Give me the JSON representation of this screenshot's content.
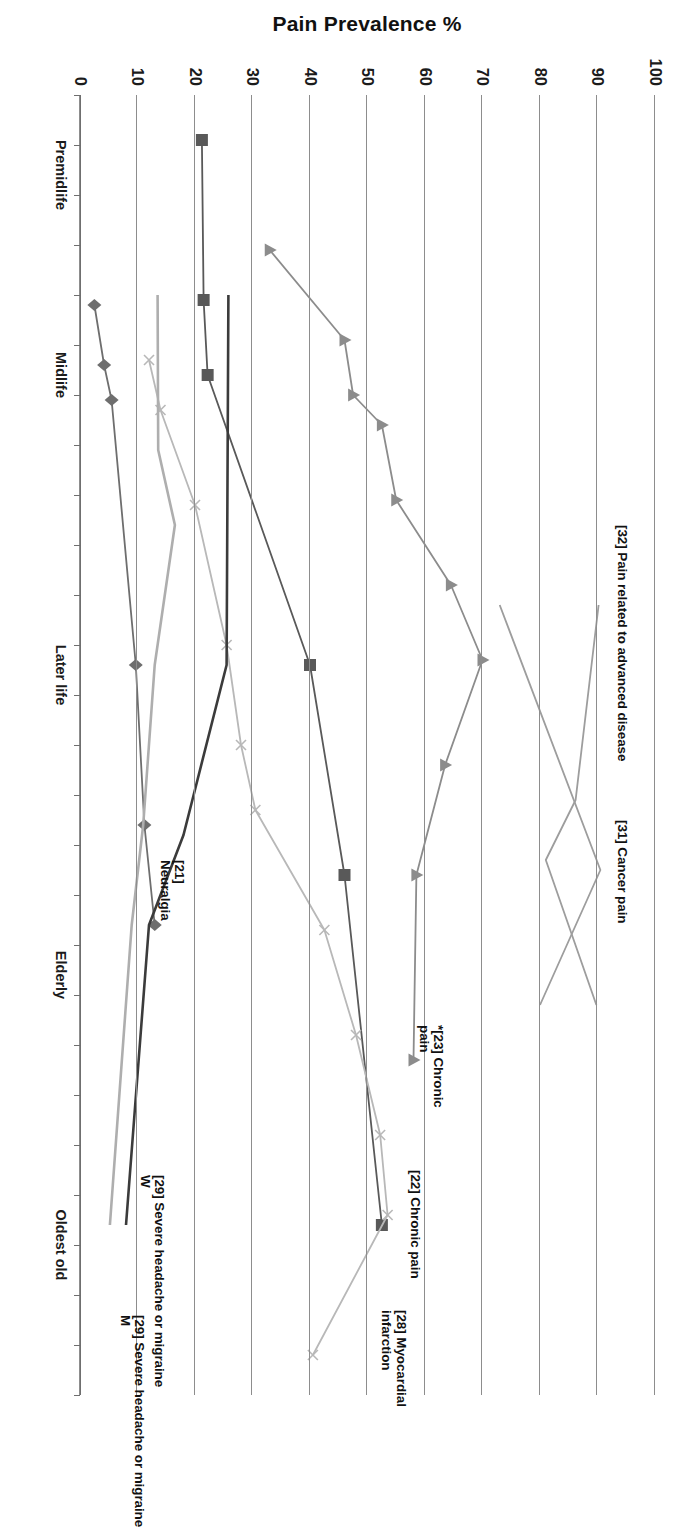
{
  "chart_data": {
    "type": "line",
    "title": "",
    "xlabel": "",
    "ylabel": "Pain Prevalence %",
    "ylim": [
      0,
      100
    ],
    "ytick_labels": [
      "100",
      "90",
      "80",
      "70",
      "60",
      "50",
      "40",
      "30",
      "20",
      "10",
      "0"
    ],
    "ytick_values": [
      100,
      90,
      80,
      70,
      60,
      50,
      40,
      30,
      20,
      10,
      0
    ],
    "grid": "horizontal-only",
    "legend": "inline-end-labels",
    "x": [
      0,
      1,
      2,
      3,
      4,
      5,
      6,
      7,
      8,
      9,
      10,
      11,
      12,
      13,
      14,
      15,
      16,
      17,
      18,
      19,
      20,
      21,
      22,
      23,
      24,
      25,
      26
    ],
    "categories": [
      "Premidlife",
      "Midlife",
      "Later life",
      "Elderly",
      "Oldest old"
    ],
    "category_positions": [
      1.6,
      5.6,
      11.6,
      17.6,
      23.0
    ],
    "series": [
      {
        "name": "[32] Pain related to advanced disease",
        "label": "[32] Pain related to advanced disease",
        "marker": "none",
        "color": "#9d9d9d",
        "points": [
          {
            "x": 10.2,
            "y": 73.0
          },
          {
            "x": 15.5,
            "y": 90.5
          },
          {
            "x": 18.2,
            "y": 80.0
          }
        ]
      },
      {
        "name": "[31] Cancer pain",
        "label": "[31] Cancer pain",
        "marker": "none",
        "color": "#9d9d9d",
        "points": [
          {
            "x": 10.2,
            "y": 90.2
          },
          {
            "x": 14.1,
            "y": 86.2
          },
          {
            "x": 15.3,
            "y": 81.0
          },
          {
            "x": 18.2,
            "y": 89.8
          }
        ]
      },
      {
        "name": "*[23] Chronic pain",
        "label": "*[23] Chronic\npain",
        "marker": "triangle",
        "color": "#8c8c8c",
        "points": [
          {
            "x": 3.1,
            "y": 33.0
          },
          {
            "x": 4.9,
            "y": 46.0
          },
          {
            "x": 6.0,
            "y": 47.5
          },
          {
            "x": 6.6,
            "y": 52.5
          },
          {
            "x": 8.1,
            "y": 55.0
          },
          {
            "x": 9.8,
            "y": 64.5
          },
          {
            "x": 11.3,
            "y": 70.0
          },
          {
            "x": 13.4,
            "y": 63.5
          },
          {
            "x": 15.6,
            "y": 58.5
          },
          {
            "x": 19.3,
            "y": 58.0
          }
        ]
      },
      {
        "name": "[22] Chronic pain",
        "label": "[22] Chronic pain",
        "marker": "square",
        "color": "#595959",
        "points": [
          {
            "x": 0.9,
            "y": 21.2
          },
          {
            "x": 4.1,
            "y": 21.5
          },
          {
            "x": 5.6,
            "y": 22.2
          },
          {
            "x": 11.4,
            "y": 40.0
          },
          {
            "x": 15.6,
            "y": 46.0
          },
          {
            "x": 22.6,
            "y": 52.5
          }
        ]
      },
      {
        "name": "[28] Myocardial infarction",
        "label": "[28] Myocardial\ninfarction",
        "marker": "cross",
        "color": "#b8b8b8",
        "points": [
          {
            "x": 5.3,
            "y": 12.0
          },
          {
            "x": 6.3,
            "y": 14.0
          },
          {
            "x": 8.2,
            "y": 20.0
          },
          {
            "x": 11.0,
            "y": 25.5
          },
          {
            "x": 13.0,
            "y": 28.0
          },
          {
            "x": 14.3,
            "y": 30.5
          },
          {
            "x": 16.7,
            "y": 42.5
          },
          {
            "x": 18.8,
            "y": 48.0
          },
          {
            "x": 20.8,
            "y": 52.2
          },
          {
            "x": 22.4,
            "y": 53.5
          },
          {
            "x": 25.2,
            "y": 40.5
          }
        ]
      },
      {
        "name": "[21] Neuralgia",
        "label": "[21]\nNeuralgia",
        "marker": "diamond",
        "color": "#6e6e6e",
        "points": [
          {
            "x": 4.2,
            "y": 2.5
          },
          {
            "x": 5.4,
            "y": 4.2
          },
          {
            "x": 6.1,
            "y": 5.5
          },
          {
            "x": 11.4,
            "y": 9.7
          },
          {
            "x": 14.6,
            "y": 11.2
          },
          {
            "x": 16.6,
            "y": 13.0
          }
        ]
      },
      {
        "name": "[29] Severe headache or migraine W",
        "label": "[29] Severe headache or migraine\nW",
        "marker": "none",
        "color": "#3b3b3b",
        "points": [
          {
            "x": 4.0,
            "y": 25.8
          },
          {
            "x": 11.4,
            "y": 25.5
          },
          {
            "x": 14.8,
            "y": 18.0
          },
          {
            "x": 16.6,
            "y": 12.0
          },
          {
            "x": 22.6,
            "y": 8.0
          }
        ]
      },
      {
        "name": "[29] Severe headache or migraine M",
        "label": "[29] Severe headache or migraine\nM",
        "marker": "none",
        "color": "#aeaeae",
        "points": [
          {
            "x": 4.0,
            "y": 13.5
          },
          {
            "x": 7.1,
            "y": 13.6
          },
          {
            "x": 8.6,
            "y": 16.5
          },
          {
            "x": 11.4,
            "y": 13.0
          },
          {
            "x": 14.6,
            "y": 11.0
          },
          {
            "x": 16.6,
            "y": 9.0
          },
          {
            "x": 22.6,
            "y": 5.2
          }
        ]
      }
    ],
    "annotations": [
      {
        "id": "ann-32",
        "text": "[32] Pain related to advanced disease"
      },
      {
        "id": "ann-31",
        "text": "[31] Cancer pain"
      },
      {
        "id": "ann-23",
        "text": "*[23] Chronic\npain"
      },
      {
        "id": "ann-22",
        "text": "[22] Chronic pain"
      },
      {
        "id": "ann-28",
        "text": "[28] Myocardial\ninfarction"
      },
      {
        "id": "ann-21",
        "text": "[21]\nNeuralgia"
      },
      {
        "id": "ann-29w",
        "text": "[29] Severe headache or migraine\nW"
      },
      {
        "id": "ann-29m",
        "text": "[29] Severe headache or migraine\nM"
      }
    ]
  },
  "axis": {
    "y_title": "Pain Prevalence %",
    "y_ticks": [
      "100",
      "90",
      "80",
      "70",
      "60",
      "50",
      "40",
      "30",
      "20",
      "10",
      "0"
    ],
    "x_categories": [
      "Premidlife",
      "Midlife",
      "Later life",
      "Elderly",
      "Oldest old"
    ]
  },
  "labels": {
    "advanced_disease": "[32] Pain related to advanced disease",
    "cancer_pain": "[31] Cancer pain",
    "chronic_pain_23": "*[23] Chronic\npain",
    "chronic_pain_22": "[22] Chronic pain",
    "myocardial": "[28] Myocardial\ninfarction",
    "neuralgia": "[21]\nNeuralgia",
    "migraine_w": "[29] Severe headache or migraine\nW",
    "migraine_m": "[29] Severe headache or migraine\nM"
  },
  "colors": {
    "grid": "#8d8d8d",
    "axis": "#6f6f6f",
    "text": "#111111"
  }
}
